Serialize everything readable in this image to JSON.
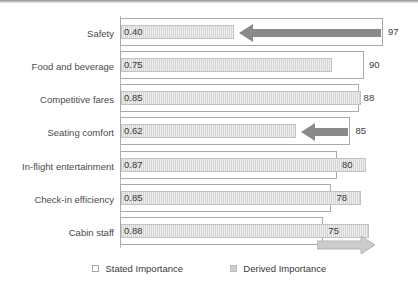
{
  "chart_data": {
    "type": "bar",
    "orientation": "horizontal",
    "title": "",
    "xlabel": "",
    "ylabel": "",
    "grid": false,
    "legend_position": "bottom",
    "categories": [
      "Safety",
      "Food and beverage",
      "Competitive fares",
      "Seating comfort",
      "In-flight entertainment",
      "Check-in efficiency",
      "Cabin staff"
    ],
    "series": [
      {
        "name": "Stated Importance",
        "values": [
          97,
          90,
          88,
          85,
          80,
          78,
          75
        ],
        "value_labels": [
          "97",
          "90",
          "88",
          "85",
          "80",
          "78",
          "75"
        ],
        "range": [
          0,
          100
        ],
        "color": "#ffffff",
        "border_color": "#aaaaaa"
      },
      {
        "name": "Derived Importance",
        "values": [
          0.4,
          0.75,
          0.85,
          0.62,
          0.87,
          0.85,
          0.88
        ],
        "value_labels": [
          "0.40",
          "0.75",
          "0.85",
          "0.62",
          "0.87",
          "0.85",
          "0.88"
        ],
        "range": [
          0,
          1
        ],
        "color": "#d4d4d4",
        "border_color": "#c2c2c2"
      }
    ],
    "annotations": [
      {
        "label": "arrow-safety",
        "category": "Safety",
        "direction": "left",
        "color": "#8a8a8a"
      },
      {
        "label": "arrow-seating-comfort",
        "category": "Seating comfort",
        "direction": "left",
        "color": "#8a8a8a"
      },
      {
        "label": "arrow-cabin-staff",
        "category": "Cabin staff",
        "direction": "right",
        "color": "#cccccc"
      }
    ]
  },
  "legend": {
    "items": [
      {
        "label": "Stated Importance",
        "swatch": "white-square"
      },
      {
        "label": "Derived Importance",
        "swatch": "gray-square"
      }
    ]
  }
}
